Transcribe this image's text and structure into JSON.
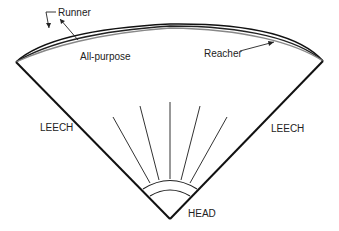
{
  "diagram": {
    "labels": {
      "runner": "Runner",
      "all_purpose": "All-purpose",
      "reacher": "Reacher",
      "leech_left": "LEECH",
      "leech_right": "LEECH",
      "head": "HEAD"
    },
    "colors": {
      "stroke": "#111111",
      "curve_grey": "#888888",
      "text": "#222222"
    }
  }
}
